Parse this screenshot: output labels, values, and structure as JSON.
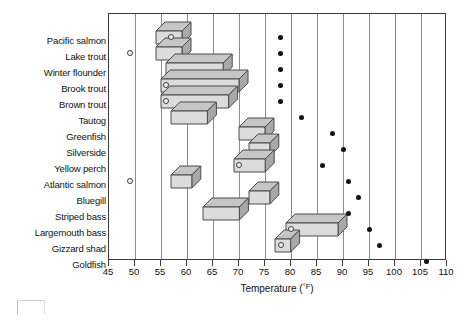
{
  "chart_data": {
    "type": "bar",
    "title": "",
    "xlabel": "Temperature (°F)",
    "ylabel": "",
    "xlim": [
      45,
      110
    ],
    "xticks": [
      45,
      50,
      55,
      60,
      65,
      70,
      75,
      80,
      85,
      90,
      95,
      100,
      105,
      110
    ],
    "grid": "vertical",
    "legend": "none",
    "orientation": "horizontal",
    "categories": [
      "Pacific salmon",
      "Lake trout",
      "Winter flounder",
      "Brook trout",
      "Brown trout",
      "Tautog",
      "Greenfish",
      "Silverside",
      "Yellow perch",
      "Atlantic salmon",
      "Bluegill",
      "Striped bass",
      "Largemouth bass",
      "Gizzard shad",
      "Goldfish"
    ],
    "series": [
      {
        "name": "Tolerance range (3-D bar)",
        "units": "°F",
        "ranges": [
          [
            54,
            59
          ],
          [
            54,
            59
          ],
          [
            56,
            67
          ],
          [
            55,
            70
          ],
          [
            55,
            68
          ],
          [
            57,
            64
          ],
          [
            70,
            75
          ],
          [
            72,
            76
          ],
          [
            69,
            75
          ],
          [
            57,
            61
          ],
          [
            72,
            76
          ],
          [
            63,
            70
          ],
          [
            79,
            89
          ],
          [
            77,
            80
          ],
          [
            null,
            null
          ]
        ]
      },
      {
        "name": "Preferred temperature (open circle)",
        "units": "°F",
        "values": [
          57,
          49,
          null,
          56,
          56,
          null,
          null,
          null,
          70,
          49,
          null,
          null,
          80,
          78,
          null
        ]
      },
      {
        "name": "Upper lethal limit (filled dot)",
        "units": "°F",
        "values": [
          78,
          78,
          78,
          78,
          78,
          82,
          88,
          90,
          86,
          91,
          93,
          91,
          95,
          97,
          106
        ]
      }
    ],
    "bar_values": {
      "starts": [
        54,
        54,
        56,
        55,
        55,
        57,
        70,
        72,
        69,
        57,
        72,
        63,
        79,
        77,
        null
      ],
      "ends": [
        59,
        59,
        67,
        70,
        68,
        64,
        75,
        76,
        75,
        61,
        76,
        70,
        89,
        80,
        null
      ]
    }
  },
  "axis": {
    "tick_labels": [
      "45",
      "50",
      "55",
      "60",
      "65",
      "70",
      "75",
      "80",
      "85",
      "90",
      "95",
      "100",
      "105",
      "110"
    ],
    "title_text": "Temperature (",
    "title_unit": "°F",
    "title_close": ")"
  }
}
